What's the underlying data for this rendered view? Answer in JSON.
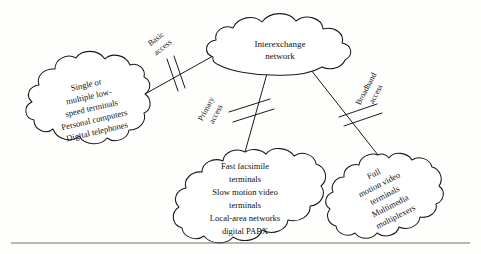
{
  "figure": {
    "background_color": "#fefefd",
    "line_color": "#1a1a1a",
    "text_color": "#101010",
    "rule_color": "#6d6d6d"
  },
  "clouds": {
    "interexchange": {
      "name": "interexchange-network-cloud",
      "lines": [
        "Interexchange",
        "network"
      ],
      "line1": "Interexchange",
      "line2": "network",
      "rotation_deg": 0
    },
    "low_speed": {
      "name": "low-speed-terminals-cloud",
      "lines": [
        "Single or",
        "multiple low-",
        "speed terminals",
        "Personal computers",
        "Digital telephones"
      ],
      "line1": "Single or",
      "line2": "multiple low-",
      "line3": "speed terminals",
      "line4": "Personal computers",
      "line5": "Digital telephones",
      "rotation_deg": -13
    },
    "primary": {
      "name": "fast-facsimile-cloud",
      "lines": [
        "Fast facsimile",
        "terminals",
        "Slow motion video",
        "terminals",
        "Local-area networks",
        "digital PABX"
      ],
      "line1": "Fast facsimile",
      "line2": "terminals",
      "line3": "Slow motion video",
      "line4": "terminals",
      "line5": "Local-area networks",
      "line6": "digital PABX",
      "rotation_deg": 0
    },
    "broadband": {
      "name": "full-motion-video-cloud",
      "lines": [
        "Full",
        "motion video",
        "terminals",
        "Multimedia",
        "multiplexers"
      ],
      "line1": "Full",
      "line2": "motion video",
      "line3": "terminals",
      "line4": "Multimedia",
      "line5": "multiplexers",
      "rotation_deg": -27
    }
  },
  "access_labels": {
    "basic": {
      "name": "basic-access-label",
      "line1": "Basic",
      "line2": "access",
      "rotation_deg": -38
    },
    "primary": {
      "name": "primary-access-label",
      "line1": "Primary",
      "line2": "access",
      "rotation_deg": -62
    },
    "broadband": {
      "name": "broadband-access-label",
      "line1": "Broadband",
      "line2": "access",
      "rotation_deg": -62
    }
  }
}
